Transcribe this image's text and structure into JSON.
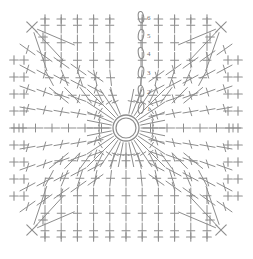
{
  "diagram": {
    "type": "crochet-pattern-chart",
    "background_color": "#ffffff",
    "line_color": "#8d8d8d",
    "label_color": "#6e6e6e",
    "canvas": {
      "width": 253,
      "height": 259
    },
    "center_ring": {
      "name": "magic-ring",
      "cx": 126,
      "cy": 128,
      "outer_radius": 13,
      "inner_radius": 10
    },
    "chain_column": {
      "name": "turning-chain",
      "x": 143,
      "labels": [
        "1",
        "2",
        "3",
        "4",
        "5",
        "6"
      ],
      "label_positions_y": [
        110,
        93,
        74,
        55,
        37,
        19
      ],
      "chain_count": 6
    },
    "rounds": 6,
    "grid": {
      "columns": 13,
      "rows": 13,
      "spacing_x": 16.2,
      "spacing_y": 17.0,
      "origin_x": 29,
      "origin_y": 20
    },
    "symbols": {
      "plus": "single-crochet",
      "tee": "double-crochet",
      "x_cross": "crossed-stitch",
      "oval": "chain-stitch",
      "ring": "magic-ring"
    },
    "legend_present": false,
    "corners": [
      {
        "name": "corner-top-left",
        "x": 32,
        "y": 27
      },
      {
        "name": "corner-top-right",
        "x": 221,
        "y": 27
      },
      {
        "name": "corner-bottom-left",
        "x": 32,
        "y": 230
      },
      {
        "name": "corner-bottom-right",
        "x": 221,
        "y": 230
      }
    ]
  },
  "chart_data": {
    "type": "diagram",
    "rounds": 6,
    "round_labels": [
      "1",
      "2",
      "3",
      "4",
      "5",
      "6"
    ],
    "xlabel": "",
    "ylabel": "",
    "grid": false,
    "legend": []
  }
}
